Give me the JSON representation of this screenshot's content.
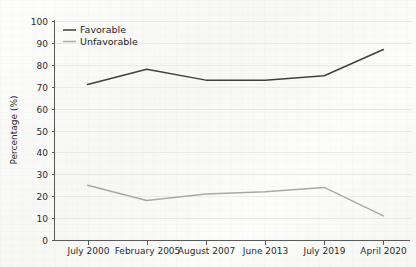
{
  "chart_data": {
    "type": "line",
    "title": "",
    "subtitle": "",
    "xlabel": "",
    "ylabel": "Percentage (%)",
    "ylim": [
      0,
      100
    ],
    "ytick_step": 10,
    "yticks": [
      "0",
      "10",
      "20",
      "30",
      "40",
      "50",
      "60",
      "70",
      "80",
      "90",
      "100"
    ],
    "grid": true,
    "grid_orientation": "horizontal",
    "legend_position": "top-left-inside",
    "categories": [
      "July 2000",
      "February 2005",
      "August 2007",
      "June 2013",
      "July 2019",
      "April 2020"
    ],
    "series": [
      {
        "name": "Favorable",
        "color": "#404040",
        "values": [
          71,
          78,
          73,
          73,
          75,
          87
        ]
      },
      {
        "name": "Unfavorable",
        "color": "#a9a9a9",
        "values": [
          25,
          18,
          21,
          22,
          24,
          11
        ]
      }
    ],
    "annotations": []
  },
  "legend": {
    "items": [
      {
        "label": "Favorable",
        "color": "#404040"
      },
      {
        "label": "Unfavorable",
        "color": "#a9a9a9"
      }
    ]
  },
  "axes": {
    "y_title": "Percentage (%)"
  }
}
